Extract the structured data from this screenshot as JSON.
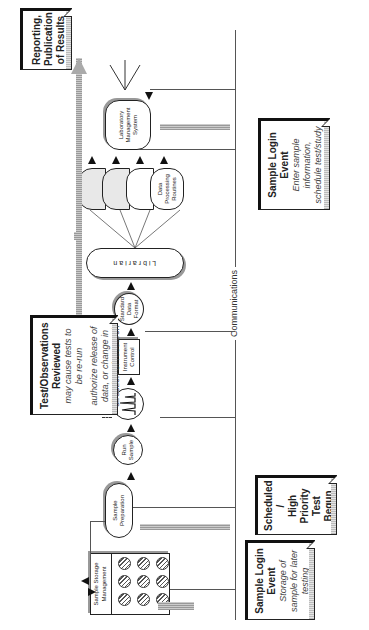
{
  "diagram": {
    "orientation": "rotated 90 degrees counter-clockwise",
    "events": {
      "sample_login_storage": {
        "title": "Sample Login Event",
        "subtitle": "Storage of sample for later testing"
      },
      "scheduled": {
        "title_lines": [
          "Scheduled",
          "/",
          "High",
          "Priority",
          "Test",
          "Begun"
        ]
      },
      "reviewed": {
        "title": "Test/Observations Reviewed",
        "line1": "may cause tests to be re-run",
        "line2": "authorize release of data, or change in direction of research"
      },
      "sample_login_enter": {
        "title": "Sample Login Event",
        "subtitle": "Enter sample information, schedule test/study"
      },
      "reporting": {
        "title": "Reporting, Publication of Results"
      }
    },
    "nodes": {
      "storage": "Sample Storage Management",
      "prep": "Sample Preparation",
      "run": "Run Sample",
      "instrument": "Instrument Control",
      "format": "Standard Data Format",
      "librarian": "L i b r a r i a n",
      "processing": "Data Processing Routines",
      "lims": "Laboratory Management System"
    },
    "communications_label": "Communications",
    "colors": {
      "line": "#555555",
      "grey_arrow": "#aaaaaa",
      "ink": "#222222"
    }
  }
}
